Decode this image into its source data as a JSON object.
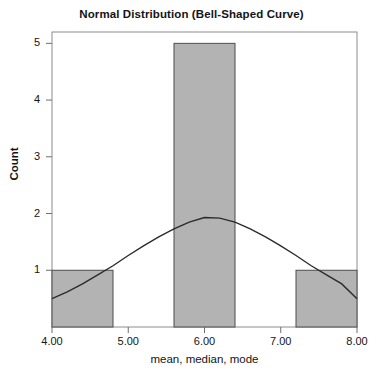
{
  "chart_data": {
    "type": "bar",
    "title": "Normal Distribution (Bell-Shaped Curve)",
    "xlabel": "mean, median, mode",
    "ylabel": "Count",
    "xlim": [
      4.0,
      8.0
    ],
    "ylim": [
      0,
      5.2
    ],
    "grid": false,
    "legend": null,
    "x_tick_labels": [
      "4.00",
      "5.00",
      "6.00",
      "7.00",
      "8.00"
    ],
    "x_tick_values": [
      4.0,
      5.0,
      6.0,
      7.0,
      8.0
    ],
    "y_tick_labels": [
      "1",
      "2",
      "3",
      "4",
      "5"
    ],
    "y_tick_values": [
      1,
      2,
      3,
      4,
      5
    ],
    "bars": [
      {
        "label": "4.00-4.80",
        "x_start": 4.0,
        "x_end": 4.8,
        "center": 4.4,
        "value": 1
      },
      {
        "label": "5.60-6.40",
        "x_start": 5.6,
        "x_end": 6.4,
        "center": 6.0,
        "value": 5
      },
      {
        "label": "7.20-8.00",
        "x_start": 7.2,
        "x_end": 8.0,
        "center": 7.6,
        "value": 1
      }
    ],
    "categories": [
      "4.00-4.80",
      "5.60-6.40",
      "7.20-8.00"
    ],
    "values": [
      1,
      5,
      1
    ],
    "overlay_curve": {
      "name": "normal-curve",
      "kind": "line",
      "mean": 6.0,
      "sigma": 1.1,
      "peak_value": 1.93,
      "x": [
        4.0,
        4.2,
        4.4,
        4.6,
        4.8,
        5.0,
        5.2,
        5.4,
        5.6,
        5.8,
        6.0,
        6.2,
        6.4,
        6.6,
        6.8,
        7.0,
        7.2,
        7.4,
        7.6,
        7.8,
        8.0
      ],
      "y": [
        0.5,
        0.62,
        0.76,
        0.92,
        1.08,
        1.26,
        1.43,
        1.59,
        1.73,
        1.85,
        1.93,
        1.92,
        1.85,
        1.73,
        1.59,
        1.43,
        1.26,
        1.08,
        0.92,
        0.76,
        0.5
      ]
    },
    "colors": {
      "bar_fill": "#b3b3b3",
      "bar_edge": "#4d4d4d",
      "curve": "#2b2b2b",
      "axis": "#808080",
      "text": "#141414",
      "background": "#ffffff"
    }
  }
}
